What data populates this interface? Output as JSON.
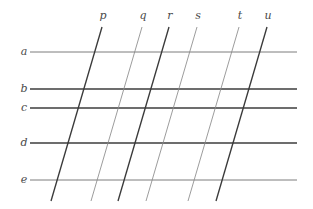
{
  "figure": {
    "background_color": "#ffffff",
    "width": 313,
    "height": 209
  },
  "horizontal_lines": {
    "label_color": "#4a4a4a",
    "x_start": 30,
    "x_end": 297,
    "label_x": 24,
    "items": [
      {
        "label": "a",
        "y": 52,
        "color": "#6e6e6e",
        "width": 0.9
      },
      {
        "label": "b",
        "y": 89,
        "color": "#3d3d3d",
        "width": 1.3
      },
      {
        "label": "c",
        "y": 108,
        "color": "#3d3d3d",
        "width": 1.3
      },
      {
        "label": "d",
        "y": 143,
        "color": "#3d3d3d",
        "width": 1.3
      },
      {
        "label": "e",
        "y": 180,
        "color": "#6e6e6e",
        "width": 0.9
      }
    ]
  },
  "transversal_lines": {
    "label_color": "#4a4a4a",
    "label_y": 16,
    "y_top": 27,
    "y_bottom": 201,
    "dx_over_run": -45,
    "items": [
      {
        "label": "p",
        "label_x": 103,
        "x_top": 102,
        "x_bottom": 51,
        "color": "#3a3a3a",
        "width": 1.35
      },
      {
        "label": "q",
        "label_x": 143,
        "x_top": 142,
        "x_bottom": 91,
        "color": "#8a8a8a",
        "width": 0.85
      },
      {
        "label": "r",
        "label_x": 170,
        "x_top": 169,
        "x_bottom": 118,
        "color": "#3a3a3a",
        "width": 1.35
      },
      {
        "label": "s",
        "label_x": 198,
        "x_top": 197,
        "x_bottom": 146,
        "color": "#8a8a8a",
        "width": 0.85
      },
      {
        "label": "t",
        "label_x": 240,
        "x_top": 239,
        "x_bottom": 188,
        "color": "#8a8a8a",
        "width": 0.85
      },
      {
        "label": "u",
        "label_x": 268,
        "x_top": 267,
        "x_bottom": 216,
        "color": "#3a3a3a",
        "width": 1.35
      }
    ]
  }
}
